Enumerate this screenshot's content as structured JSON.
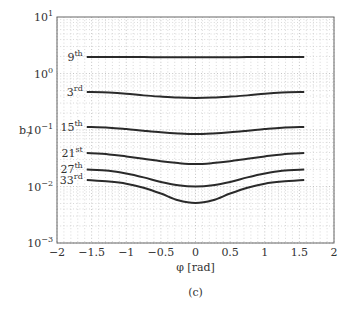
{
  "chart_data": {
    "type": "line",
    "title": "",
    "caption": "(c)",
    "xlabel": "φ [rad]",
    "ylabel": "b",
    "ylabel_sub": "7",
    "xlim": [
      -2,
      2
    ],
    "ylim": [
      0.001,
      10
    ],
    "yscale": "log",
    "grid": true,
    "x_ticks": [
      -2,
      -1.5,
      -1,
      -0.5,
      0,
      0.5,
      1,
      1.5,
      2
    ],
    "x_tick_labels": [
      "−2",
      "−1.5",
      "−1",
      "−0.5",
      "0",
      "0.5",
      "1",
      "1.5",
      "2"
    ],
    "y_ticks": [
      {
        "value": 10,
        "base": "10",
        "exp": "1"
      },
      {
        "value": 1,
        "base": "10",
        "exp": "0"
      },
      {
        "value": 0.1,
        "base": "10",
        "exp": "−1"
      },
      {
        "value": 0.01,
        "base": "10",
        "exp": "−2"
      },
      {
        "value": 0.001,
        "base": "10",
        "exp": "−3"
      }
    ],
    "x": [
      -1.57,
      -1.25,
      -1.0,
      -0.75,
      -0.5,
      -0.25,
      0,
      0.25,
      0.5,
      0.75,
      1.0,
      1.25,
      1.57
    ],
    "series": [
      {
        "name": "9th",
        "label": "9",
        "sup": "th",
        "values": [
          1.96,
          1.96,
          1.95,
          1.95,
          1.94,
          1.94,
          1.94,
          1.94,
          1.94,
          1.95,
          1.95,
          1.96,
          1.96
        ]
      },
      {
        "name": "3rd",
        "label": "3",
        "sup": "rd",
        "values": [
          0.47,
          0.46,
          0.44,
          0.41,
          0.39,
          0.375,
          0.37,
          0.375,
          0.39,
          0.41,
          0.44,
          0.46,
          0.47
        ]
      },
      {
        "name": "15th",
        "label": "15",
        "sup": "th",
        "values": [
          0.113,
          0.11,
          0.104,
          0.097,
          0.091,
          0.087,
          0.085,
          0.087,
          0.091,
          0.097,
          0.104,
          0.11,
          0.113
        ]
      },
      {
        "name": "21st",
        "label": "21",
        "sup": "st",
        "values": [
          0.039,
          0.037,
          0.034,
          0.031,
          0.028,
          0.026,
          0.025,
          0.026,
          0.028,
          0.031,
          0.034,
          0.037,
          0.039
        ]
      },
      {
        "name": "27th",
        "label": "27",
        "sup": "th",
        "values": [
          0.02,
          0.019,
          0.017,
          0.0145,
          0.012,
          0.0105,
          0.01,
          0.0105,
          0.012,
          0.0145,
          0.017,
          0.019,
          0.02
        ]
      },
      {
        "name": "33rd",
        "label": "33",
        "sup": "rd",
        "values": [
          0.013,
          0.0122,
          0.0112,
          0.0095,
          0.0075,
          0.0057,
          0.0051,
          0.0057,
          0.0075,
          0.0095,
          0.0112,
          0.0122,
          0.013
        ]
      }
    ]
  }
}
